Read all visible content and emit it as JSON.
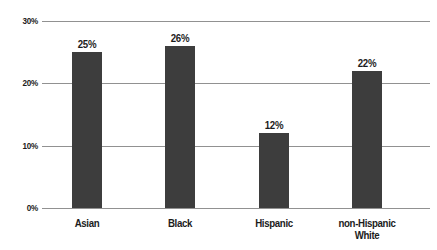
{
  "chart_data": {
    "type": "bar",
    "title": "",
    "categories": [
      "Asian",
      "Black",
      "Hispanic",
      "non-Hispanic White"
    ],
    "values": [
      25,
      26,
      12,
      22
    ],
    "value_labels": [
      "25%",
      "26%",
      "12%",
      "22%"
    ],
    "yticks": [
      {
        "value": 0,
        "label": "0%"
      },
      {
        "value": 10,
        "label": "10%"
      },
      {
        "value": 20,
        "label": "20%"
      },
      {
        "value": 30,
        "label": "30%"
      }
    ],
    "ylim": [
      0,
      30
    ],
    "xlabel": "",
    "ylabel": "",
    "grid": true,
    "legend": "none",
    "colors": {
      "bar": "#3d3d3d",
      "gridline": "#919191",
      "text": "#1c1c1c",
      "background": "#ffffff"
    }
  }
}
